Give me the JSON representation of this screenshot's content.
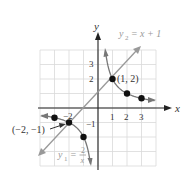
{
  "chart_data": {
    "type": "line",
    "title": "",
    "xlabel": "x",
    "ylabel": "y",
    "xlim": [
      -4,
      4
    ],
    "ylim": [
      -4,
      4
    ],
    "grid": true,
    "x_ticks": [
      -2,
      1,
      2,
      3
    ],
    "y_ticks": [
      -1,
      2,
      3
    ],
    "series": [
      {
        "name": "y1 = 2/x",
        "label_parts": {
          "lhs": "y",
          "sub": "1",
          "eq": " = ",
          "num": "2",
          "den": "x"
        },
        "type": "hyperbola",
        "points": [
          [
            -3,
            -0.67
          ],
          [
            -2,
            -1
          ],
          [
            -1,
            -2
          ],
          [
            1,
            2
          ],
          [
            2,
            1
          ],
          [
            3,
            0.67
          ]
        ],
        "color": "#777777"
      },
      {
        "name": "y2 = x + 1",
        "label_parts": {
          "lhs": "y",
          "sub": "2",
          "eq": " = ",
          "rhs": "x + 1"
        },
        "type": "line",
        "points": [
          [
            -4,
            -3
          ],
          [
            3,
            4
          ]
        ],
        "color": "#999999"
      }
    ],
    "annotations": [
      {
        "text": "(1, 2)",
        "x": 1,
        "y": 2
      },
      {
        "text": "(−2, −1)",
        "x": -2,
        "y": -1
      }
    ],
    "tick_labels": {
      "x": [
        "−2",
        "1",
        "2",
        "3"
      ],
      "y": [
        "−1",
        "2",
        "3"
      ]
    },
    "axis_labels": {
      "x": "x",
      "y": "y"
    },
    "colors": {
      "grid": "#d9d9d9",
      "axis": "#222222",
      "curve": "#777777",
      "line": "#999999",
      "point": "#111111"
    }
  }
}
